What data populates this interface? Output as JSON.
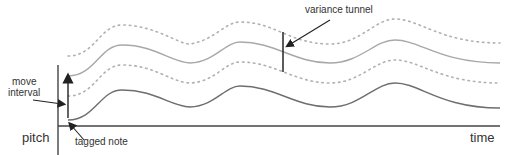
{
  "diagram": {
    "labels": {
      "variance_tunnel": "variance tunnel",
      "move_interval_line1": "move",
      "move_interval_line2": "interval",
      "tagged_note": "tagged note",
      "y_axis": "pitch",
      "x_axis": "time"
    },
    "colors": {
      "axis": "#444444",
      "upper_curve": "#a8a8a8",
      "lower_curve": "#6e6e6e",
      "dotted": "#b0b0b0",
      "text": "#333333"
    },
    "elements": [
      "upper dotted bound",
      "upper melodic contour",
      "middle dotted bound",
      "lower melodic contour",
      "move interval arrow",
      "variance tunnel marker"
    ]
  }
}
